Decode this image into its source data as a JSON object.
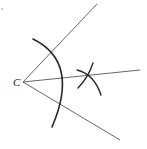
{
  "diagram": {
    "vertex_label": "C",
    "vertex": {
      "x": 23,
      "y": 82
    },
    "rays": [
      {
        "name": "upper-ray",
        "x2": 97,
        "y2": 4
      },
      {
        "name": "bisector-ray",
        "x2": 140,
        "y2": 70
      },
      {
        "name": "lower-ray",
        "x2": 120,
        "y2": 140
      }
    ],
    "colors": {
      "line": "#555555",
      "arc": "#2a2a2a",
      "background": "#ffffff"
    }
  }
}
